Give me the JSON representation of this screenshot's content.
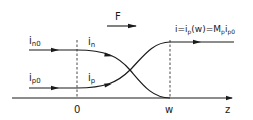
{
  "diagram": {
    "force_label": "F",
    "labels": {
      "in0_main": "i",
      "in0_sub": "n0",
      "ip0_main": "i",
      "ip0_sub": "p0",
      "in_main": "i",
      "in_sub": "n",
      "ip_main": "i",
      "ip_sub": "p",
      "result_eq_a": "i=i",
      "result_sub_p1": "p",
      "result_eq_b": "(w)=M",
      "result_sub_p2": "p",
      "result_eq_c": "i",
      "result_sub_p0": "p0"
    },
    "axis": {
      "origin_label": "0",
      "w_label": "w",
      "z_label": "z"
    },
    "colors": {
      "line": "#1a1a1a",
      "background": "#ffffff"
    }
  }
}
